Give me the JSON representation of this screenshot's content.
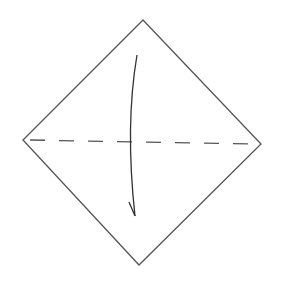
{
  "diagram": {
    "type": "origami-step",
    "background": "#ffffff",
    "stroke_color": "#555555",
    "paper": {
      "shape": "diamond",
      "vertices": {
        "top": [
          143,
          20
        ],
        "right": [
          261,
          144
        ],
        "bottom": [
          139,
          265
        ],
        "left": [
          23,
          140
        ]
      }
    },
    "valley_fold_line": {
      "style": "dashed",
      "from": [
        30,
        140
      ],
      "to": [
        250,
        144
      ],
      "dash": "15 14"
    },
    "fold_arrow": {
      "direction": "down",
      "start": [
        137,
        55
      ],
      "end": [
        135,
        216
      ],
      "head": "half-left"
    }
  }
}
